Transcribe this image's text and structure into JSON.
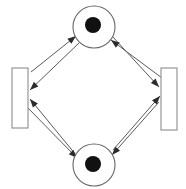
{
  "diagram": {
    "kind": "petri-net",
    "canvas": {
      "width": 186,
      "height": 189,
      "background": "#ffffff"
    },
    "colors": {
      "background": "#ffffff",
      "place_stroke": "#676767",
      "place_fill": "#ffffff",
      "token_fill": "#111111",
      "transition_stroke": "#8d8d8d",
      "transition_fill": "#ffffff",
      "arc_stroke": "#5a5a5a",
      "arrowhead_fill": "#2b2b2b"
    },
    "places": [
      {
        "id": "p-top",
        "label": "",
        "shape": "circle",
        "cx": 94,
        "cy": 27,
        "r": 21,
        "tokens": 1,
        "token": {
          "cx": 93,
          "cy": 25,
          "r": 8
        }
      },
      {
        "id": "p-bottom",
        "label": "",
        "shape": "circle",
        "cx": 94,
        "cy": 165,
        "r": 21,
        "tokens": 1,
        "token": {
          "cx": 93,
          "cy": 164,
          "r": 8
        }
      }
    ],
    "transitions": [
      {
        "id": "t-left",
        "label": "",
        "shape": "rectangle",
        "x": 12,
        "y": 68,
        "width": 16,
        "height": 60
      },
      {
        "id": "t-right",
        "label": "",
        "shape": "rectangle",
        "x": 161,
        "y": 68,
        "width": 16,
        "height": 62
      }
    ],
    "arcs": [
      {
        "id": "a1",
        "from": "t-left",
        "to": "p-top",
        "x1": 31,
        "y1": 72,
        "x2": 76,
        "y2": 36,
        "head": "end"
      },
      {
        "id": "a2",
        "from": "p-top",
        "to": "t-right",
        "x1": 112,
        "y1": 36,
        "x2": 159,
        "y2": 87,
        "head": "end"
      },
      {
        "id": "a3",
        "from": "t-right",
        "to": "p-bottom",
        "x1": 159,
        "y1": 102,
        "x2": 112,
        "y2": 155,
        "head": "end"
      },
      {
        "id": "a4",
        "from": "p-bottom",
        "to": "t-left",
        "x1": 76,
        "y1": 155,
        "x2": 30,
        "y2": 99,
        "head": "end"
      },
      {
        "id": "a5",
        "from": "p-top",
        "to": "t-left",
        "x1": 79,
        "y1": 43,
        "x2": 30,
        "y2": 90,
        "head": "end"
      },
      {
        "id": "a6",
        "from": "t-right",
        "to": "p-top",
        "x1": 162,
        "y1": 78,
        "x2": 111,
        "y2": 40,
        "head": "end"
      },
      {
        "id": "a7",
        "from": "p-bottom",
        "to": "t-right",
        "x1": 113,
        "y1": 150,
        "x2": 160,
        "y2": 96,
        "head": "end"
      },
      {
        "id": "a8",
        "from": "t-left",
        "to": "p-bottom",
        "x1": 26,
        "y1": 106,
        "x2": 77,
        "y2": 158,
        "head": "end"
      }
    ]
  }
}
